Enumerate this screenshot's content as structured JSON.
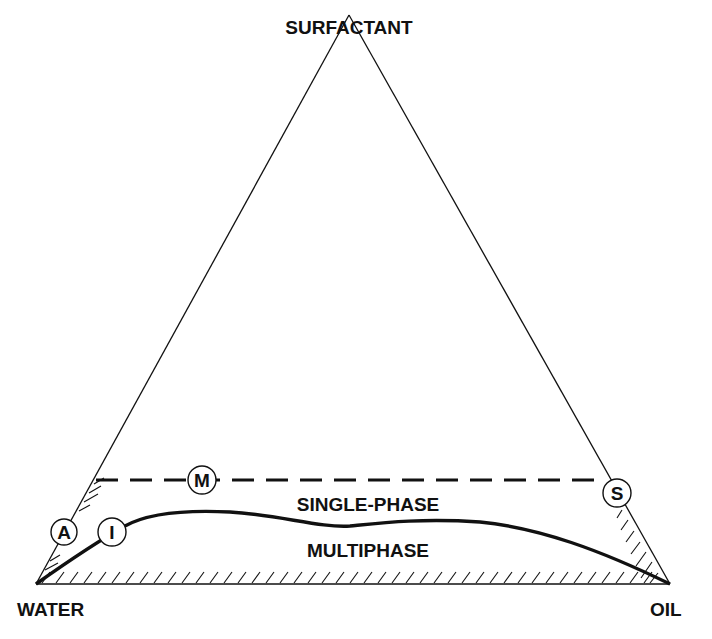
{
  "diagram": {
    "type": "ternary-phase-diagram",
    "vertices": {
      "top": "SURFACTANT",
      "bottom_left": "WATER",
      "bottom_right": "OIL"
    },
    "regions": {
      "upper": "SINGLE-PHASE",
      "lower": "MULTIPHASE"
    },
    "markers": [
      {
        "id": "A",
        "label": "A"
      },
      {
        "id": "I",
        "label": "I"
      },
      {
        "id": "M",
        "label": "M"
      },
      {
        "id": "S",
        "label": "S"
      }
    ],
    "colors": {
      "ink": "#111111",
      "background": "#ffffff"
    }
  }
}
